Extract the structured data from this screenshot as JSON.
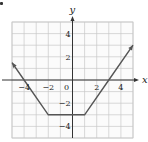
{
  "chart_data": {
    "type": "line",
    "title": "",
    "xlabel": "x",
    "ylabel": "y",
    "xlim": [
      -5,
      5
    ],
    "ylim": [
      -5,
      5
    ],
    "grid": true,
    "x_ticks": [
      -4,
      -2,
      0,
      2,
      4
    ],
    "y_ticks": [
      4,
      2,
      -2,
      -4
    ],
    "x_tick_labels": [
      "−4",
      "−2",
      "0",
      "2",
      "4"
    ],
    "y_tick_labels": [
      "4",
      "2",
      "−2",
      "−4"
    ],
    "origin_label": "0",
    "series": [
      {
        "name": "f(x)",
        "points": [
          [
            -5,
            1.5
          ],
          [
            -4,
            0
          ],
          [
            -2,
            -3
          ],
          [
            1,
            -3
          ],
          [
            3,
            0
          ],
          [
            5,
            3
          ]
        ],
        "arrows": "both-ends",
        "color": "#555555"
      }
    ]
  },
  "colors": {
    "grid": "#c8c8c8",
    "axis": "#333333",
    "curve": "#555555"
  }
}
